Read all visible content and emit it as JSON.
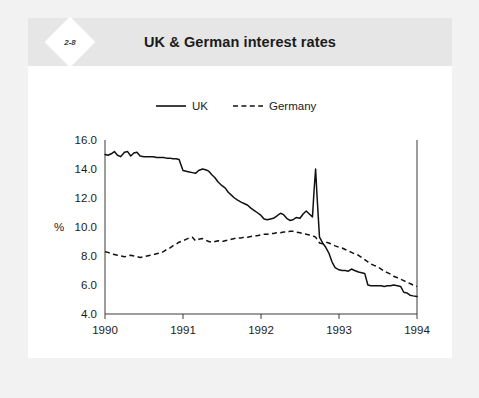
{
  "figure": {
    "badge": "2-8",
    "title": "UK & German interest rates"
  },
  "chart_data": {
    "type": "line",
    "title": "UK & German interest rates",
    "xlabel": "",
    "ylabel": "%",
    "xlim": [
      1990.0,
      1994.0
    ],
    "ylim": [
      4.0,
      16.0
    ],
    "yticks": [
      "4.0",
      "6.0",
      "8.0",
      "10.0",
      "12.0",
      "14.0",
      "16.0"
    ],
    "ytick_values": [
      4.0,
      6.0,
      8.0,
      10.0,
      12.0,
      14.0,
      16.0
    ],
    "xticks": [
      "1990",
      "1991",
      "1992",
      "1993",
      "1994"
    ],
    "xtick_values": [
      1990,
      1991,
      1992,
      1993,
      1994
    ],
    "grid": false,
    "legend_position": "above-plot",
    "series": [
      {
        "name": "UK",
        "style": "solid",
        "color": "#111111",
        "x": [
          1990.0,
          1990.04,
          1990.08,
          1990.12,
          1990.16,
          1990.2,
          1990.25,
          1990.29,
          1990.33,
          1990.37,
          1990.41,
          1990.45,
          1990.5,
          1990.54,
          1990.58,
          1990.62,
          1990.66,
          1990.7,
          1990.75,
          1990.79,
          1990.83,
          1990.87,
          1990.91,
          1990.95,
          1991.0,
          1991.04,
          1991.08,
          1991.12,
          1991.16,
          1991.2,
          1991.25,
          1991.29,
          1991.33,
          1991.37,
          1991.41,
          1991.45,
          1991.5,
          1991.54,
          1991.58,
          1991.62,
          1991.66,
          1991.7,
          1991.75,
          1991.79,
          1991.83,
          1991.87,
          1991.91,
          1991.95,
          1992.0,
          1992.04,
          1992.08,
          1992.12,
          1992.16,
          1992.2,
          1992.25,
          1992.29,
          1992.33,
          1992.37,
          1992.41,
          1992.45,
          1992.5,
          1992.54,
          1992.58,
          1992.62,
          1992.66,
          1992.68,
          1992.7,
          1992.72,
          1992.75,
          1992.79,
          1992.83,
          1992.87,
          1992.91,
          1992.95,
          1993.0,
          1993.04,
          1993.08,
          1993.12,
          1993.16,
          1993.2,
          1993.25,
          1993.29,
          1993.33,
          1993.37,
          1993.41,
          1993.45,
          1993.5,
          1993.54,
          1993.58,
          1993.62,
          1993.66,
          1993.7,
          1993.75,
          1993.79,
          1993.83,
          1993.87,
          1993.91,
          1993.95,
          1994.0
        ],
        "y": [
          15.0,
          14.95,
          15.05,
          15.2,
          14.95,
          14.85,
          15.15,
          15.2,
          14.9,
          15.1,
          15.15,
          14.9,
          14.85,
          14.85,
          14.85,
          14.85,
          14.8,
          14.8,
          14.8,
          14.75,
          14.75,
          14.7,
          14.7,
          14.65,
          13.9,
          13.85,
          13.8,
          13.75,
          13.7,
          13.9,
          14.0,
          13.95,
          13.85,
          13.6,
          13.4,
          13.1,
          12.85,
          12.7,
          12.4,
          12.2,
          12.0,
          11.85,
          11.7,
          11.6,
          11.5,
          11.3,
          11.15,
          11.0,
          10.8,
          10.55,
          10.5,
          10.55,
          10.6,
          10.75,
          10.95,
          10.85,
          10.6,
          10.45,
          10.5,
          10.65,
          10.6,
          10.9,
          11.1,
          10.9,
          10.7,
          12.5,
          14.0,
          12.0,
          9.3,
          8.9,
          8.6,
          8.2,
          7.6,
          7.2,
          7.05,
          7.0,
          7.0,
          6.95,
          7.1,
          7.0,
          6.9,
          6.85,
          6.8,
          6.0,
          5.95,
          5.95,
          5.95,
          5.95,
          5.9,
          5.95,
          5.95,
          6.0,
          5.95,
          5.9,
          5.5,
          5.45,
          5.3,
          5.25,
          5.2
        ]
      },
      {
        "name": "Germany",
        "style": "dashed",
        "color": "#111111",
        "x": [
          1990.0,
          1990.04,
          1990.08,
          1990.12,
          1990.16,
          1990.2,
          1990.25,
          1990.29,
          1990.33,
          1990.37,
          1990.41,
          1990.45,
          1990.5,
          1990.54,
          1990.58,
          1990.62,
          1990.66,
          1990.7,
          1990.75,
          1990.79,
          1990.83,
          1990.87,
          1990.91,
          1990.95,
          1991.0,
          1991.04,
          1991.08,
          1991.12,
          1991.16,
          1991.2,
          1991.25,
          1991.29,
          1991.33,
          1991.37,
          1991.41,
          1991.45,
          1991.5,
          1991.54,
          1991.58,
          1991.62,
          1991.66,
          1991.7,
          1991.75,
          1991.79,
          1991.83,
          1991.87,
          1991.91,
          1991.95,
          1992.0,
          1992.04,
          1992.08,
          1992.12,
          1992.16,
          1992.2,
          1992.25,
          1992.29,
          1992.33,
          1992.37,
          1992.41,
          1992.45,
          1992.5,
          1992.54,
          1992.58,
          1992.62,
          1992.66,
          1992.7,
          1992.75,
          1992.79,
          1992.83,
          1992.87,
          1992.91,
          1992.95,
          1993.0,
          1993.04,
          1993.08,
          1993.12,
          1993.16,
          1993.2,
          1993.25,
          1993.29,
          1993.33,
          1993.37,
          1993.41,
          1993.45,
          1993.5,
          1993.54,
          1993.58,
          1993.62,
          1993.66,
          1993.7,
          1993.75,
          1993.79,
          1993.83,
          1993.87,
          1993.91,
          1993.95,
          1994.0
        ],
        "y": [
          8.3,
          8.25,
          8.15,
          8.1,
          8.05,
          8.0,
          7.95,
          8.0,
          8.05,
          8.0,
          7.95,
          7.9,
          7.95,
          8.0,
          8.05,
          8.1,
          8.15,
          8.2,
          8.3,
          8.45,
          8.55,
          8.7,
          8.8,
          8.95,
          9.05,
          9.15,
          9.25,
          9.3,
          9.05,
          9.15,
          9.2,
          9.1,
          9.0,
          8.95,
          9.0,
          9.05,
          9.0,
          9.05,
          9.1,
          9.15,
          9.2,
          9.25,
          9.25,
          9.3,
          9.3,
          9.35,
          9.4,
          9.4,
          9.45,
          9.5,
          9.5,
          9.55,
          9.55,
          9.6,
          9.6,
          9.65,
          9.65,
          9.7,
          9.7,
          9.65,
          9.6,
          9.55,
          9.5,
          9.45,
          9.4,
          9.3,
          8.9,
          8.85,
          8.95,
          8.9,
          8.8,
          8.7,
          8.6,
          8.55,
          8.45,
          8.35,
          8.25,
          8.15,
          8.05,
          7.9,
          7.75,
          7.6,
          7.45,
          7.35,
          7.25,
          7.1,
          6.95,
          6.85,
          6.75,
          6.6,
          6.5,
          6.4,
          6.3,
          6.2,
          6.1,
          6.0,
          5.9
        ]
      }
    ]
  }
}
